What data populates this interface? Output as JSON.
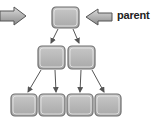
{
  "diagram": {
    "type": "tree",
    "annotation_label": "parent",
    "levels": [
      {
        "level": 0,
        "nodes": 1
      },
      {
        "level": 1,
        "nodes": 2
      },
      {
        "level": 2,
        "nodes": 4
      }
    ],
    "node_color": "#b5b5b5",
    "node_border": "#6f6f6f",
    "arrow_color": "#555555"
  }
}
